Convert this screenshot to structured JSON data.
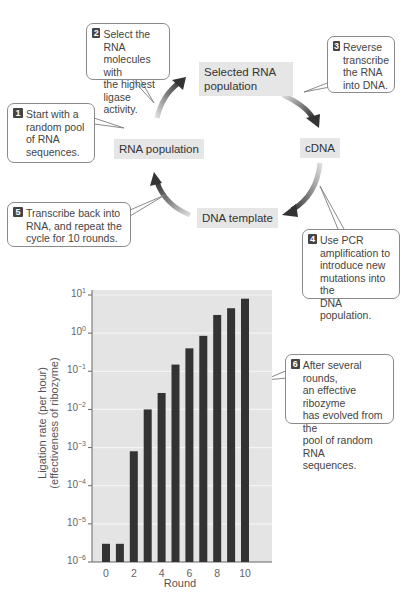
{
  "cycle": {
    "nodes": {
      "selected_rna": "Selected RNA\npopulation",
      "cdna": "cDNA",
      "dna_template": "DNA template",
      "rna_population": "RNA population"
    },
    "steps": [
      {
        "n": "1",
        "text": "Start with a\nrandom pool\nof RNA\nsequences."
      },
      {
        "n": "2",
        "text": "Select the RNA\nmolecules with\nthe highest\nligase activity."
      },
      {
        "n": "3",
        "text": "Reverse\ntranscribe\nthe RNA\ninto DNA."
      },
      {
        "n": "4",
        "text": "Use PCR\namplification to\nintroduce new\nmutations into the\nDNA population."
      },
      {
        "n": "5",
        "text": "Transcribe back into\nRNA, and repeat the\ncycle for 10 rounds."
      },
      {
        "n": "6",
        "text": "After several rounds,\nan effective ribozyme\nhas evolved from the\npool of random RNA\nsequences."
      }
    ]
  },
  "chart_data": {
    "type": "bar",
    "title": "",
    "xlabel": "Round",
    "ylabel": "Ligation rate (per hour)\n(effectiveness of ribozyme)",
    "yscale": "log",
    "ylim": [
      1e-06,
      10
    ],
    "y_ticks": [
      "10^-6",
      "10^-5",
      "10^-4",
      "10^-3",
      "10^-2",
      "10^-1",
      "10^0",
      "10^1"
    ],
    "x_ticks": [
      "0",
      "2",
      "4",
      "6",
      "8",
      "10"
    ],
    "categories": [
      0,
      1,
      2,
      3,
      4,
      5,
      6,
      7,
      8,
      9,
      10
    ],
    "values": [
      3e-06,
      3e-06,
      0.0008,
      0.01,
      0.027,
      0.15,
      0.4,
      0.85,
      3,
      4.5,
      8
    ],
    "grid": true,
    "bar_color": "#333333",
    "background": "#e4e4e4"
  }
}
